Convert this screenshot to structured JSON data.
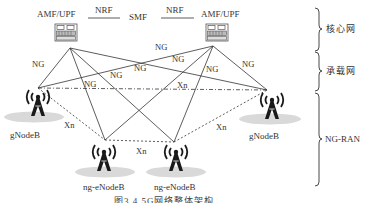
{
  "figure": {
    "caption": "图3.4   5G网络整体架构",
    "core": {
      "left_node": "AMF/UPF",
      "right_node": "AMF/UPF",
      "center_node": "SMF",
      "left_link": "NRF",
      "right_link": "NRF"
    },
    "ran_nodes": {
      "gnb_left": "gNodeB",
      "gnb_right": "gNodeB",
      "ngenb_left": "ng-eNodeB",
      "ngenb_right": "ng-eNodeB"
    },
    "link_labels": {
      "ng": "NG",
      "xn": "Xn"
    },
    "layers": [
      {
        "label": "核心网"
      },
      {
        "label": "承载网"
      },
      {
        "label": "NG-RAN"
      }
    ],
    "colors": {
      "line": "#333333",
      "ellipse": "#d9d9d9",
      "tower": "#1a1a1a"
    }
  }
}
